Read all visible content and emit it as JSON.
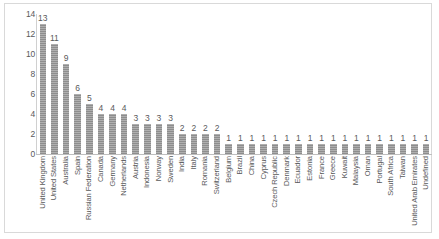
{
  "chart_data": {
    "type": "bar",
    "title": "",
    "xlabel": "",
    "ylabel": "",
    "ylim": [
      0,
      14
    ],
    "yticks": [
      0,
      2,
      4,
      6,
      8,
      10,
      12,
      14
    ],
    "grid": false,
    "legend": "none",
    "bar_color": "#8d8d8d",
    "data_labels_shown": true,
    "categories": [
      "United Kingdom",
      "United States",
      "Australia",
      "Spain",
      "Russian Federation",
      "Canada",
      "Germany",
      "Netherlands",
      "Austria",
      "Indonesia",
      "Norway",
      "Sweden",
      "India",
      "Italy",
      "Romania",
      "Switzerland",
      "Belgium",
      "Brazil",
      "China",
      "Cyprus",
      "Czech Republic",
      "Denmark",
      "Ecuador",
      "Estonia",
      "France",
      "Greece",
      "Kuwait",
      "Malaysia",
      "Oman",
      "Portugal",
      "South Africa",
      "Taiwan",
      "United Arab Emirates",
      "Undefined"
    ],
    "values": [
      13,
      11,
      9,
      6,
      5,
      4,
      4,
      4,
      3,
      3,
      3,
      3,
      2,
      2,
      2,
      2,
      1,
      1,
      1,
      1,
      1,
      1,
      1,
      1,
      1,
      1,
      1,
      1,
      1,
      1,
      1,
      1,
      1,
      1
    ]
  }
}
